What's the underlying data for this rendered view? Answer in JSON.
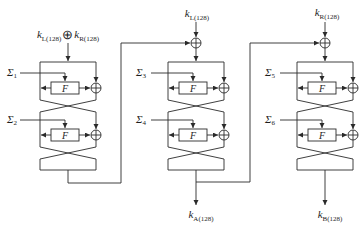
{
  "diagram": {
    "inputs": {
      "col1": {
        "left_var": "k",
        "left_sub": "L(128)",
        "op": "⊕",
        "right_var": "k",
        "right_sub": "R(128)"
      },
      "col2": {
        "var": "k",
        "sub": "L(128)"
      },
      "col3": {
        "var": "k",
        "sub": "R(128)"
      }
    },
    "outputs": {
      "col2": {
        "var": "k",
        "sub": "A(128)"
      },
      "col3": {
        "var": "k",
        "sub": "B(128)"
      }
    },
    "sigmas": [
      {
        "sym": "Σ",
        "sub": "1"
      },
      {
        "sym": "Σ",
        "sub": "2"
      },
      {
        "sym": "Σ",
        "sub": "3"
      },
      {
        "sym": "Σ",
        "sub": "4"
      },
      {
        "sym": "Σ",
        "sub": "5"
      },
      {
        "sym": "Σ",
        "sub": "6"
      }
    ],
    "f_label": "F",
    "colors": {
      "line": "#2a2a2a",
      "background": "#ffffff"
    }
  }
}
